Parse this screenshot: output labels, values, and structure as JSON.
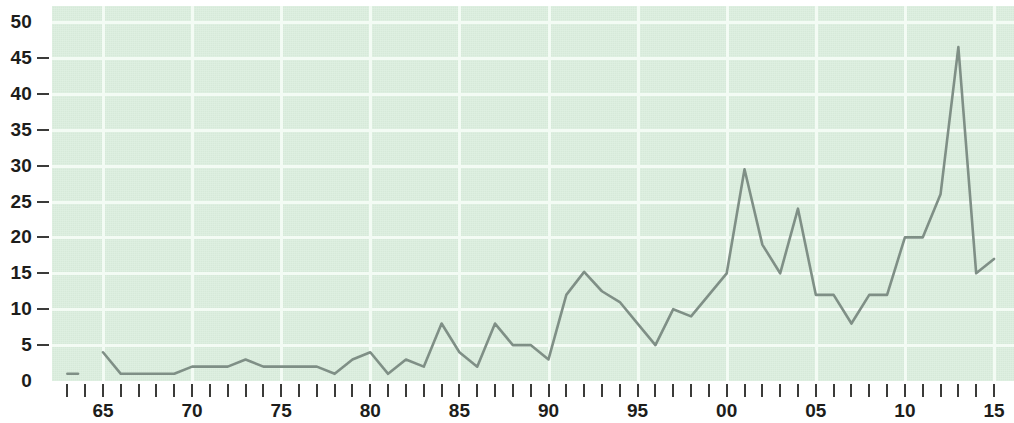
{
  "chart_data": {
    "type": "line",
    "title": "",
    "subtitle": "",
    "xlabel": "",
    "ylabel": "",
    "ylim": [
      0,
      50
    ],
    "ytick_values": [
      0,
      5,
      10,
      15,
      20,
      25,
      30,
      35,
      40,
      45,
      50
    ],
    "ytick_labels": [
      "0",
      "5",
      "10",
      "15",
      "20",
      "25",
      "30",
      "35",
      "40",
      "45",
      "50"
    ],
    "xlim": [
      1963,
      2015
    ],
    "xtick_labeled_years": [
      1965,
      1970,
      1975,
      1980,
      1985,
      1990,
      1995,
      2000,
      2005,
      2010,
      2015
    ],
    "xtick_labels": [
      "65",
      "70",
      "75",
      "80",
      "85",
      "90",
      "95",
      "00",
      "05",
      "10",
      "15"
    ],
    "xtick_minor_step": 1,
    "grid": true,
    "grid_color": "#f3fbf4",
    "plot_background": "#dcefdf",
    "line_color": "#7f8f86",
    "line_width": 2.6,
    "legend": [],
    "annotations": [],
    "series": [
      {
        "name": "series-1",
        "segments": [
          {
            "name": "isolated-marker",
            "x": [
              1963,
              1963.6
            ],
            "y": [
              1,
              1
            ]
          },
          {
            "name": "main-line",
            "x": [
              1965,
              1966,
              1967,
              1968,
              1969,
              1970,
              1971,
              1972,
              1973,
              1974,
              1975,
              1976,
              1977,
              1978,
              1979,
              1980,
              1981,
              1982,
              1983,
              1984,
              1985,
              1986,
              1987,
              1988,
              1989,
              1990,
              1991,
              1992,
              1993,
              1994,
              1995,
              1996,
              1997,
              1998,
              1999,
              2000,
              2001,
              2002,
              2003,
              2004,
              2005,
              2006,
              2007,
              2008,
              2009,
              2010,
              2011,
              2012,
              2013,
              2014,
              2015
            ],
            "y": [
              4,
              1,
              1,
              1,
              1,
              2,
              2,
              2,
              3,
              2,
              2,
              2,
              2,
              1,
              3,
              4,
              1,
              3,
              2,
              8,
              4,
              2,
              8,
              5,
              5,
              3,
              12,
              15.2,
              12.5,
              11,
              8,
              5,
              10,
              9,
              12,
              15,
              29.5,
              19,
              15,
              24,
              12,
              12,
              8,
              12,
              12,
              20,
              20,
              26,
              46.5,
              15,
              17
            ]
          }
        ]
      }
    ]
  }
}
